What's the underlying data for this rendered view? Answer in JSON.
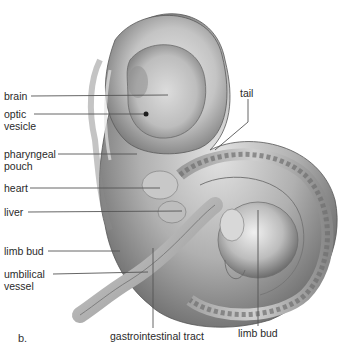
{
  "figure": {
    "panel_letter": "b.",
    "colors": {
      "background": "#ffffff",
      "tissue_light": "#e6e6e6",
      "tissue_mid": "#b9b9b9",
      "tissue_dark": "#6e6e6e",
      "leader_line": "#555555",
      "text": "#2a2a2a"
    },
    "labels_left": [
      {
        "id": "brain",
        "lines": [
          "brain"
        ]
      },
      {
        "id": "optic-vesicle",
        "lines": [
          "optic",
          "vesicle"
        ]
      },
      {
        "id": "pharyngeal-pouch",
        "lines": [
          "pharyngeal",
          "pouch"
        ]
      },
      {
        "id": "heart",
        "lines": [
          "heart"
        ]
      },
      {
        "id": "liver",
        "lines": [
          "liver"
        ]
      },
      {
        "id": "limb-bud-upper",
        "lines": [
          "limb bud"
        ]
      },
      {
        "id": "umbilical-vessel",
        "lines": [
          "umbilical",
          "vessel"
        ]
      }
    ],
    "labels_top": [
      {
        "id": "tail",
        "lines": [
          "tail"
        ]
      }
    ],
    "labels_bottom": [
      {
        "id": "gastrointestinal-tract",
        "lines": [
          "gastrointestinal tract"
        ]
      },
      {
        "id": "limb-bud-lower",
        "lines": [
          "limb bud"
        ]
      }
    ]
  }
}
